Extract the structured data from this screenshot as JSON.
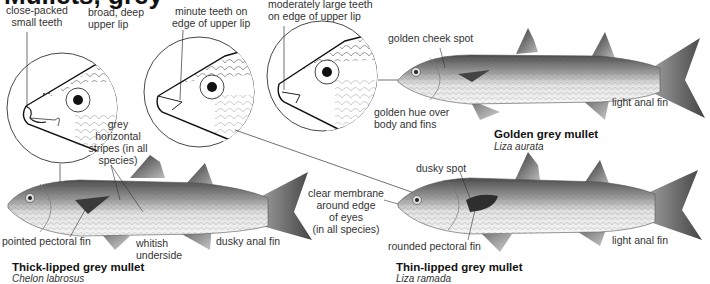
{
  "page": {
    "title": "Mullets, grey"
  },
  "detail_circles": [
    {
      "id": "thick-lipped-head",
      "labels": [
        "close-packed\nsmall teeth",
        "broad, deep\nupper lip"
      ]
    },
    {
      "id": "thin-lipped-head",
      "labels": [
        "minute teeth on\nedge of upper lip"
      ]
    },
    {
      "id": "golden-head",
      "labels": [
        "moderately large teeth\non edge of upper lip"
      ]
    }
  ],
  "labels": {
    "close_packed_1": "close-packed",
    "close_packed_2": "small teeth",
    "broad_lip_1": "broad, deep",
    "broad_lip_2": "upper lip",
    "minute_teeth_1": "minute teeth on",
    "minute_teeth_2": "edge of upper lip",
    "moderate_teeth_1": "moderately large teeth",
    "moderate_teeth_2": "on edge of upper lip",
    "golden_cheek": "golden cheek spot",
    "golden_hue_1": "golden hue over",
    "golden_hue_2": "body and fins",
    "light_anal_golden": "light anal fin",
    "grey_stripes_1": "grey",
    "grey_stripes_2": "horizontal",
    "grey_stripes_3": "stripes  (in all",
    "grey_stripes_4": "species)",
    "pointed_pectoral": "pointed pectoral fin",
    "whitish_1": "whitish",
    "whitish_2": "underside",
    "dusky_anal": "dusky anal fin",
    "clear_membrane_1": "clear membrane",
    "clear_membrane_2": "around edge",
    "clear_membrane_3": "of eyes",
    "clear_membrane_4": "(in all species)",
    "dusky_spot": "dusky spot",
    "rounded_pectoral": "rounded pectoral fin",
    "light_anal_thin": "light anal fin"
  },
  "species": [
    {
      "common_name": "Golden grey mullet",
      "latin_name": "Liza aurata"
    },
    {
      "common_name": "Thick-lipped grey mullet",
      "latin_name": "Chelon labrosus"
    },
    {
      "common_name": "Thin-lipped grey mullet",
      "latin_name": "Liza ramada"
    }
  ],
  "colors": {
    "ink": "#222222",
    "fish_dark": "#555555",
    "fish_mid": "#9a9a9a",
    "fish_light": "#e6e6e6"
  }
}
